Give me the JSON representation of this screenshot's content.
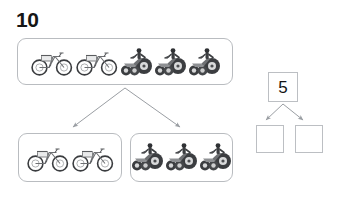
{
  "worksheet": {
    "total_label": "10",
    "background_color": "#ffffff",
    "box_border_color": "#b9bcc0",
    "arrow_color": "#9a9ea3",
    "ink_color": "#141414"
  },
  "top_group": {
    "name": "whole-group",
    "count": 5,
    "vehicles": [
      {
        "type": "bicycle",
        "icon": "bicycle-icon"
      },
      {
        "type": "bicycle",
        "icon": "bicycle-icon"
      },
      {
        "type": "tricycle",
        "icon": "tricycle-icon"
      },
      {
        "type": "tricycle",
        "icon": "tricycle-icon"
      },
      {
        "type": "tricycle",
        "icon": "tricycle-icon"
      }
    ]
  },
  "bottom_left_group": {
    "name": "part-group-bicycles",
    "count": 2,
    "vehicles": [
      {
        "type": "bicycle",
        "icon": "bicycle-icon"
      },
      {
        "type": "bicycle",
        "icon": "bicycle-icon"
      }
    ]
  },
  "bottom_right_group": {
    "name": "part-group-tricycles",
    "count": 3,
    "vehicles": [
      {
        "type": "tricycle",
        "icon": "tricycle-icon"
      },
      {
        "type": "tricycle",
        "icon": "tricycle-icon"
      },
      {
        "type": "tricycle",
        "icon": "tricycle-icon"
      }
    ]
  },
  "number_bond": {
    "whole_value": "5",
    "part_left_value": "",
    "part_right_value": ""
  }
}
